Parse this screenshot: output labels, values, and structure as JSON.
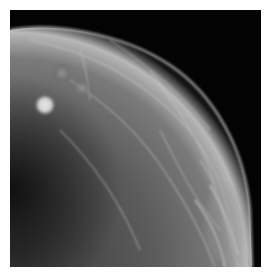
{
  "image": {
    "subject": "mammogram",
    "background_color": "#030303",
    "margin_color": "#ffffff",
    "frame": {
      "x": 10,
      "y": 10,
      "width": 251,
      "height": 257
    },
    "features": [
      {
        "name": "breast-tissue",
        "shape": "quarter-ellipse",
        "anchor": "bottom-left"
      },
      {
        "name": "dense-mass",
        "cx": 35,
        "cy": 95,
        "r": 10
      },
      {
        "name": "faint-density",
        "cx": 52,
        "cy": 63,
        "r": 9
      },
      {
        "name": "skin-line",
        "location": "right-edge"
      }
    ]
  }
}
